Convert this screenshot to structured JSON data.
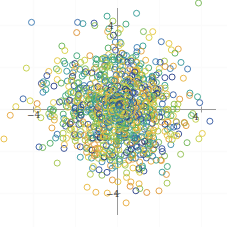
{
  "chart_data": {
    "type": "scatter",
    "title": "",
    "subtitle": "",
    "xlabel": "",
    "ylabel": "",
    "xlim": [
      -6.2,
      5.4
    ],
    "ylim": [
      -6.0,
      5.6
    ],
    "xticks": [
      -4,
      4
    ],
    "yticks": [
      -4,
      4
    ],
    "xtick_labels": [
      "−4",
      "4"
    ],
    "ytick_labels": [
      "−4",
      "4"
    ],
    "grid": true,
    "grid_color": "#fbfbfb",
    "axis_color": "#9a9a9a",
    "background": "#ffffff",
    "legend": "none",
    "marker": {
      "shape": "circle-open",
      "size": 4.0,
      "linewidth": 1.0,
      "fill": "none"
    },
    "colormap": "viridis-like",
    "color_stops": [
      "#1f2d6e",
      "#2f4b9b",
      "#3b7fb5",
      "#2e9e8f",
      "#4cab5a",
      "#94c04a",
      "#d2d23f",
      "#e8c53c",
      "#e8a93a",
      "#d98a33"
    ],
    "n_points": 1000,
    "distribution": "bivariate gaussian, mean (0,0), sigma ~1.5",
    "series": [
      {
        "name": "points",
        "color_by": "value",
        "x": [
          0.29,
          -1.02,
          1.47,
          0.05,
          -0.62,
          2.13,
          -1.88,
          0.74,
          -0.11,
          1.35,
          -2.47,
          0.93,
          0.42,
          -1.63,
          2.88,
          -0.35,
          1.06,
          -0.88,
          0.21,
          -2.05,
          1.72,
          0.58,
          -1.25,
          0.03,
          2.34,
          -0.71,
          1.19,
          -1.94,
          0.67,
          -0.28
        ],
        "y": [
          1.12,
          -0.44,
          0.83,
          -1.71,
          2.05,
          -0.36,
          0.97,
          -2.18,
          1.44,
          0.11,
          -0.79,
          1.88,
          -1.33,
          0.52,
          0.26,
          -2.41,
          1.67,
          -0.95,
          2.29,
          0.38,
          -1.56,
          1.01,
          -0.17,
          -2.63,
          0.74,
          1.93,
          -1.08,
          0.45,
          -0.62,
          2.51
        ],
        "c": [
          0.82,
          0.41,
          0.66,
          0.19,
          0.93,
          0.55,
          0.28,
          0.71,
          0.88,
          0.34,
          0.12,
          0.77,
          0.49,
          0.95,
          0.61,
          0.23,
          0.85,
          0.39,
          0.68,
          0.16,
          0.91,
          0.52,
          0.3,
          0.74,
          0.86,
          0.44,
          0.25,
          0.63,
          0.79,
          0.37
        ]
      }
    ]
  },
  "axes": {
    "x_label_negative": "−4",
    "x_label_positive": "4",
    "y_label_positive": "4",
    "y_label_negative": "−4"
  }
}
